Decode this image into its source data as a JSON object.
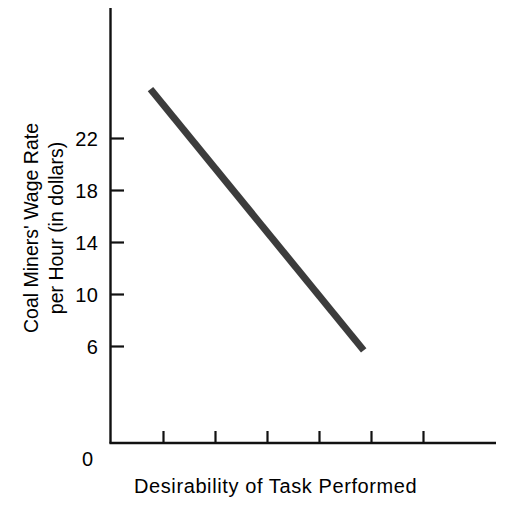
{
  "chart_data": {
    "type": "line",
    "title": "",
    "xlabel": "Desirability of Task Performed",
    "ylabel_line1": "Coal Miners' Wage Rate",
    "ylabel_line2": "per Hour (in dollars)",
    "origin_label": "0",
    "grid": false,
    "legend": "none",
    "ylim": [
      0,
      26
    ],
    "ytick_labels": [
      "22",
      "18",
      "14",
      "10",
      "6"
    ],
    "ytick_values": [
      22,
      18,
      14,
      10,
      6
    ],
    "xlim": [
      0,
      7
    ],
    "xtick_labels": [
      "",
      "",
      "",
      "",
      "",
      ""
    ],
    "xtick_values": [
      1,
      2,
      3,
      4,
      5,
      6
    ],
    "series": [
      {
        "name": "wage vs desirability",
        "color": "#3c3c3c",
        "line_width_px": 7,
        "x": [
          0.75,
          4.85
        ],
        "y": [
          25.8,
          5.7
        ],
        "points": [
          {
            "x": 0.75,
            "y": 25.8
          },
          {
            "x": 4.85,
            "y": 5.7
          }
        ]
      }
    ]
  },
  "axes": {
    "axis_color": "#111111",
    "y_axis_top_value": 26.7,
    "y_axis_bottom_value": 0
  }
}
